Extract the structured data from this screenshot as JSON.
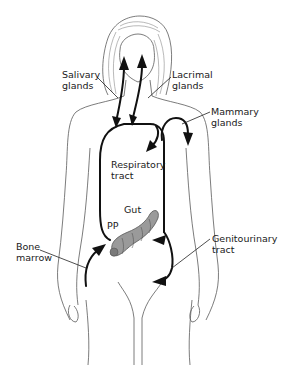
{
  "figure": {
    "background": "#ffffff",
    "line_color": "#111111",
    "gut_fill": "#9a9a9a"
  },
  "labels": {
    "salivary": {
      "line1": "Salivary",
      "line2": "glands"
    },
    "lacrimal": {
      "line1": "Lacrimal",
      "line2": "glands"
    },
    "mammary": {
      "line1": "Mammary",
      "line2": "glands"
    },
    "respiratory": {
      "line1": "Respiratory",
      "line2": "tract"
    },
    "gut": {
      "line1": "Gut"
    },
    "pp": {
      "line1": "PP"
    },
    "bone_marrow": {
      "line1": "Bone",
      "line2": "marrow"
    },
    "genitourinary": {
      "line1": "Genitourinary",
      "line2": "tract"
    }
  },
  "arrows": [
    {
      "from": "circulation",
      "to": "salivary glands"
    },
    {
      "from": "circulation",
      "to": "lacrimal glands"
    },
    {
      "from": "circulation",
      "to": "mammary glands"
    },
    {
      "from": "circulation",
      "to": "respiratory tract"
    },
    {
      "from": "bone marrow",
      "to": "PP (gut)"
    },
    {
      "from": "circulation",
      "to": "gut"
    },
    {
      "from": "circulation",
      "to": "genitourinary tract"
    }
  ]
}
